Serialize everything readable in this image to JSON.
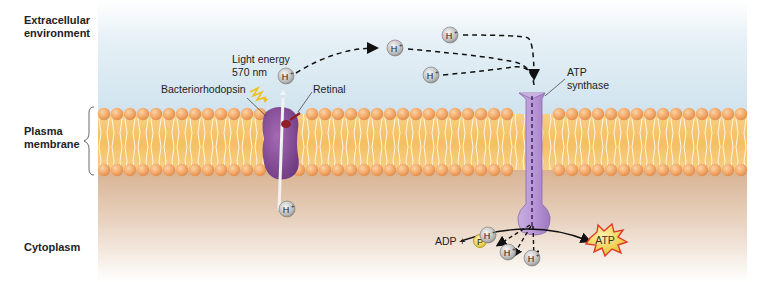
{
  "regions": {
    "extracellular": [
      "Extracellular",
      "environment"
    ],
    "membrane": [
      "Plasma",
      "membrane"
    ],
    "cytoplasm": "Cytoplasm"
  },
  "labels": {
    "light_energy": "Light energy",
    "wavelength": "570 nm",
    "bacteriorhodopsin": "Bacteriorhodopsin",
    "retinal": "Retinal",
    "atp_synthase": [
      "ATP",
      "synthase"
    ],
    "adp_plus": "ADP +",
    "phosphate": "P",
    "atp": "ATP"
  },
  "ions": {
    "proton": "H",
    "charge": "+"
  },
  "colors": {
    "extracellular_bg": "#d6e8f2",
    "cytoplasm_bg": "#d9b89a",
    "lipid_head": "#f2a766",
    "lipid_tail_bg": "#f6c877",
    "bacteriorhodopsin": "#8a4f9a",
    "atp_synthase": "#b08fce",
    "retinal": "#8e1f2b",
    "light": "#f0c020",
    "phosphate": "#f2d14a",
    "atp_burst": "#e23a2a",
    "atp_burst_fill": "#f7d24a",
    "proton": "#bcbcbc"
  }
}
